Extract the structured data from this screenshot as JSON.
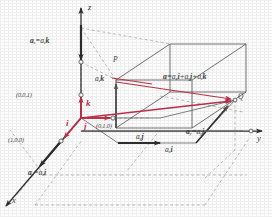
{
  "figure": {
    "colors": {
      "line": "#4a4a4a",
      "dashed": "#9a9a9a",
      "accent_red": "#c0304a",
      "arrow_dark": "#2e2e2e",
      "background": "#fefefe"
    }
  },
  "axes": [
    {
      "name": "z-axis",
      "label": "z"
    },
    {
      "name": "y-axis",
      "label": "y"
    },
    {
      "name": "x-axis",
      "label": "x"
    }
  ],
  "points": [
    {
      "name": "point-p",
      "label": "P"
    },
    {
      "name": "point-q",
      "label": "Q"
    }
  ],
  "unit_vectors": [
    {
      "name": "unit-vector-k",
      "label": "k"
    },
    {
      "name": "unit-vector-i",
      "label": "i"
    },
    {
      "name": "unit-vector-j",
      "label": "j"
    }
  ],
  "unit_points": [
    {
      "name": "coord-001",
      "label": "(0,0,1)"
    },
    {
      "name": "coord-100",
      "label": "(1,0,0)"
    },
    {
      "name": "coord-010",
      "label": "(0,1,0)"
    }
  ],
  "component_labels": {
    "z_component": {
      "base": "a",
      "sub": "z",
      "rhs_base": "a",
      "rhs_sub": "z",
      "unit": "k"
    },
    "x_component": {
      "base": "a",
      "sub": "x",
      "rhs_base": "a",
      "rhs_sub": "x",
      "unit": "i"
    },
    "y_component": {
      "base": "a",
      "sub": "y",
      "rhs_base": "a",
      "rhs_sub": "y",
      "unit": "j"
    },
    "z_projection": {
      "base": "a",
      "sub": "z",
      "unit": "k"
    },
    "y_projection": {
      "base": "a",
      "sub": "y",
      "unit": "j"
    },
    "x_projection": {
      "base": "a",
      "sub": "x",
      "unit": "i"
    }
  },
  "main_equation": {
    "lhs": "a",
    "terms": [
      {
        "coef_base": "a",
        "coef_sub": "x",
        "unit": "i"
      },
      {
        "coef_base": "a",
        "coef_sub": "y",
        "unit": "j"
      },
      {
        "coef_base": "a",
        "coef_sub": "z",
        "unit": "k"
      }
    ],
    "equals": "=",
    "plus": "+"
  }
}
